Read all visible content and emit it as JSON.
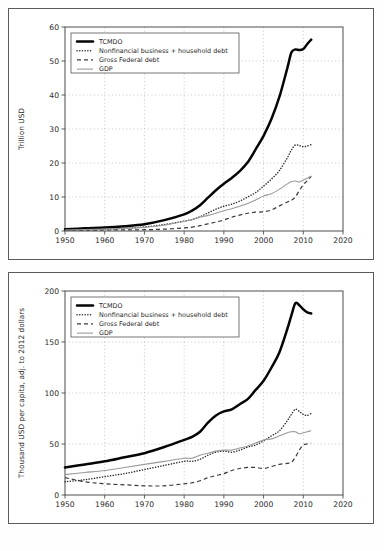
{
  "figure": {
    "panels": [
      "top",
      "bottom"
    ]
  },
  "legend": {
    "entries": [
      {
        "label": "TCMDO",
        "style": "solid-thick-black"
      },
      {
        "label": "Nonfinancial business + household debt",
        "style": "dotted-black"
      },
      {
        "label": "Gross Federal debt",
        "style": "dashed-black"
      },
      {
        "label": "GDP",
        "style": "solid-thin-gray"
      }
    ]
  },
  "chart_data": [
    {
      "type": "line",
      "panel": "top",
      "title": "",
      "xlabel": "",
      "ylabel": "Trillion USD",
      "xlim": [
        1950,
        2020
      ],
      "ylim": [
        0,
        60
      ],
      "xticks": [
        1950,
        1960,
        1970,
        1980,
        1990,
        2000,
        2010,
        2020
      ],
      "yticks": [
        0,
        10,
        20,
        30,
        40,
        50,
        60
      ],
      "grid": true,
      "legend_position": "upper-left",
      "x": [
        1950,
        1955,
        1960,
        1965,
        1970,
        1975,
        1980,
        1982,
        1984,
        1986,
        1988,
        1990,
        1992,
        1994,
        1996,
        1998,
        2000,
        2002,
        2004,
        2006,
        2007,
        2008,
        2009,
        2010,
        2011,
        2012
      ],
      "series": [
        {
          "name": "TCMDO",
          "values": [
            0.5,
            0.8,
            1.0,
            1.4,
            2.0,
            3.2,
            4.9,
            6.0,
            7.6,
            9.8,
            12.0,
            13.9,
            15.6,
            17.6,
            20.2,
            24.0,
            28.0,
            33.0,
            39.5,
            48.0,
            52.5,
            53.4,
            53.2,
            53.5,
            55.0,
            56.3
          ]
        },
        {
          "name": "Nonfinancial business + household debt",
          "values": [
            0.2,
            0.35,
            0.5,
            0.8,
            1.2,
            1.9,
            2.9,
            3.4,
            4.2,
            5.3,
            6.4,
            7.3,
            7.9,
            8.8,
            10.0,
            11.3,
            13.2,
            15.3,
            17.8,
            21.6,
            23.8,
            25.3,
            25.1,
            24.8,
            25.0,
            25.4
          ]
        },
        {
          "name": "Gross Federal debt",
          "values": [
            0.26,
            0.28,
            0.29,
            0.32,
            0.38,
            0.54,
            0.91,
            1.14,
            1.57,
            2.12,
            2.6,
            3.23,
            4.06,
            4.69,
            5.22,
            5.53,
            5.63,
            6.2,
            7.38,
            8.51,
            9.01,
            10.02,
            11.9,
            13.6,
            14.8,
            16.1
          ]
        },
        {
          "name": "GDP",
          "values": [
            0.3,
            0.43,
            0.54,
            0.74,
            1.07,
            1.69,
            2.86,
            3.34,
            4.04,
            4.59,
            5.24,
            5.98,
            6.52,
            7.31,
            8.1,
            9.09,
            10.29,
            10.98,
            12.27,
            13.86,
            14.48,
            14.72,
            14.42,
            14.96,
            15.52,
            16.16
          ]
        }
      ]
    },
    {
      "type": "line",
      "panel": "bottom",
      "title": "",
      "xlabel": "",
      "ylabel": "Thousand USD per capita, adj. to 2012 dollars",
      "xlim": [
        1950,
        2020
      ],
      "ylim": [
        0,
        200
      ],
      "xticks": [
        1950,
        1960,
        1970,
        1980,
        1990,
        2000,
        2010,
        2020
      ],
      "yticks": [
        0,
        50,
        100,
        150,
        200
      ],
      "grid": true,
      "legend_position": "upper-left",
      "x": [
        1950,
        1955,
        1960,
        1965,
        1970,
        1975,
        1980,
        1982,
        1984,
        1986,
        1988,
        1990,
        1992,
        1994,
        1996,
        1998,
        2000,
        2002,
        2004,
        2006,
        2007,
        2008,
        2009,
        2010,
        2011,
        2012
      ],
      "series": [
        {
          "name": "TCMDO",
          "values": [
            27,
            30,
            33,
            37,
            41,
            47,
            54,
            57,
            62,
            71,
            78,
            82,
            84,
            89,
            94,
            103,
            112,
            125,
            140,
            163,
            176,
            188,
            186,
            182,
            179,
            178
          ]
        },
        {
          "name": "Nonfinancial business + household debt",
          "values": [
            13,
            15,
            18,
            21,
            25,
            29,
            33,
            33,
            35,
            39,
            42,
            43,
            42,
            44,
            47,
            49,
            53,
            58,
            63,
            73,
            79,
            84,
            82,
            79,
            78,
            80
          ]
        },
        {
          "name": "Gross Federal debt",
          "values": [
            17,
            13,
            11,
            10,
            9,
            9,
            11,
            12,
            14,
            17,
            19,
            21,
            24,
            26,
            27,
            27,
            26,
            28,
            30,
            31,
            32,
            37,
            44,
            49,
            50,
            51
          ]
        },
        {
          "name": "GDP",
          "values": [
            20,
            22,
            24,
            27,
            30,
            33,
            36,
            36,
            39,
            41,
            43,
            44,
            44,
            46,
            48,
            51,
            54,
            55,
            58,
            61,
            62,
            62,
            60,
            61,
            62,
            63
          ]
        }
      ]
    }
  ]
}
